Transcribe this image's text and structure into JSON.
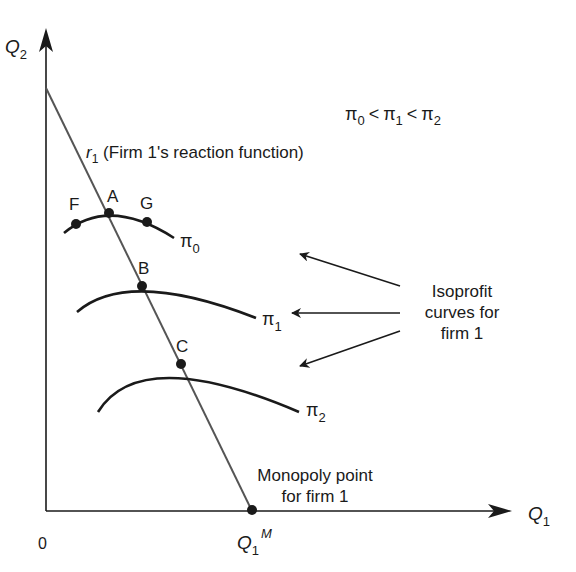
{
  "diagram": {
    "axes": {
      "y_label": "Q",
      "y_sub": "2",
      "x_label": "Q",
      "x_sub": "1",
      "origin_label": "0"
    },
    "reaction_function": {
      "symbol": "r",
      "sub": "1",
      "text": " (Firm 1's reaction function)"
    },
    "inequality": {
      "pi": "π",
      "s0": "0",
      "s1": "1",
      "s2": "2",
      "lt": "<"
    },
    "points": {
      "F": "F",
      "A": "A",
      "G": "G",
      "B": "B",
      "C": "C"
    },
    "curves": [
      {
        "symbol": "π",
        "sub": "0"
      },
      {
        "symbol": "π",
        "sub": "1"
      },
      {
        "symbol": "π",
        "sub": "2"
      }
    ],
    "annotation": {
      "line1": "Isoprofit",
      "line2": "curves for",
      "line3": "firm 1"
    },
    "monopoly": {
      "line1": "Monopoly point",
      "line2": "for firm 1",
      "tick_label": "Q",
      "tick_sub": "1",
      "tick_sup": "M"
    },
    "colors": {
      "ink": "#1a1a1a",
      "reaction_line": "#555555"
    }
  }
}
